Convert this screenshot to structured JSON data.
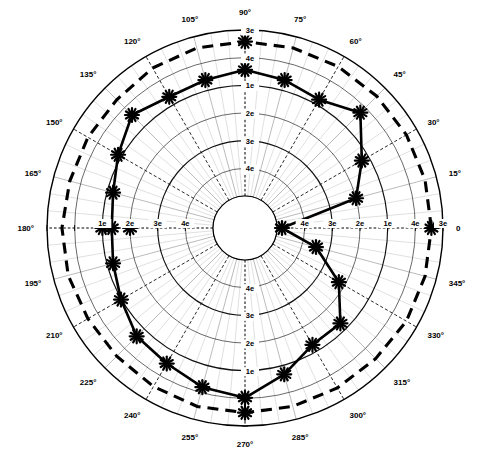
{
  "figure": {
    "title": "",
    "type": "polar-plot"
  },
  "chart_data": {
    "type": "line",
    "polar": true,
    "title": "",
    "subtitle": "",
    "xlabel": "",
    "ylabel": "",
    "grid": true,
    "legend_position": "none",
    "angle_unit": "degrees",
    "angle_ticks": [
      0,
      15,
      30,
      45,
      60,
      75,
      90,
      105,
      120,
      135,
      150,
      165,
      180,
      195,
      210,
      225,
      240,
      255,
      270,
      285,
      300,
      315,
      330,
      345
    ],
    "angle_tick_labels": [
      "0",
      "15°",
      "30°",
      "45°",
      "60°",
      "75°",
      "90°",
      "105°",
      "120°",
      "135°",
      "150°",
      "165°",
      "180°",
      "195°",
      "210°",
      "225°",
      "240°",
      "255°",
      "270°",
      "285°",
      "300°",
      "315°",
      "330°",
      "345°"
    ],
    "radial_tick_labels_outward": [
      "4e",
      "3e",
      "2e",
      "1e",
      "4e",
      "3e"
    ],
    "radial_tick_labels_inward": [
      "3e",
      "4e",
      "1e",
      "2e",
      "3e",
      "4e"
    ],
    "radial_axis_note": "logarithmic decade labels, values decrease outward",
    "n_radial_rings": 6,
    "series": [
      {
        "name": "measured-pattern",
        "style": "solid",
        "marker": "asterisk",
        "angles": [
          0,
          15,
          30,
          45,
          60,
          75,
          90,
          105,
          120,
          135,
          150,
          165,
          180,
          195,
          210,
          225,
          240,
          255,
          270,
          285,
          300,
          315,
          330,
          345
        ],
        "radii_norm": [
          0.03,
          0.5,
          0.62,
          0.79,
          0.7,
          0.73,
          0.76,
          0.73,
          0.72,
          0.77,
          0.69,
          0.63,
          0.61,
          0.63,
          0.67,
          0.73,
          0.75,
          0.8,
          0.83,
          0.72,
          0.62,
          0.62,
          0.46,
          0.25
        ]
      },
      {
        "name": "reference-pattern",
        "style": "dashed",
        "marker": "none",
        "angles": [
          0,
          15,
          30,
          45,
          60,
          75,
          90,
          105,
          120,
          135,
          150,
          165,
          180,
          195,
          210,
          225,
          240,
          255,
          270,
          285,
          300,
          315,
          330,
          345
        ],
        "radii_norm": [
          0.93,
          0.93,
          0.93,
          0.93,
          0.93,
          0.93,
          0.93,
          0.93,
          0.92,
          0.9,
          0.9,
          0.9,
          0.91,
          0.91,
          0.9,
          0.9,
          0.91,
          0.92,
          0.92,
          0.92,
          0.92,
          0.92,
          0.93,
          0.93
        ]
      }
    ]
  },
  "geometry": {
    "cx": 245,
    "cy": 228,
    "r_outer": 198,
    "r_inner": 32
  },
  "colors": {
    "axis": "#000000",
    "grid": "#2a2a2a",
    "grid_faint": "#b9b9b9",
    "series_solid": "#000000",
    "series_dashed": "#000000",
    "background": "#ffffff"
  }
}
